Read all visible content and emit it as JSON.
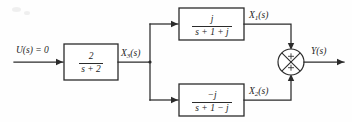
{
  "figure": {
    "type": "control-system-block-diagram",
    "background_color": "#fefefe",
    "line_color": "#2b2b2b",
    "width": 352,
    "height": 122
  },
  "signals": {
    "input": "U(s) = 0",
    "intermediate": "X",
    "intermediate_sub": "3",
    "intermediate_arg": "(s)",
    "upper_out": "X",
    "upper_out_sub": "1",
    "upper_out_arg": "(s)",
    "lower_out": "X",
    "lower_out_sub": "2",
    "lower_out_arg": "(s)",
    "output": "Y(s)"
  },
  "blocks": [
    {
      "id": "forward-block",
      "numerator": "2",
      "denominator": "s + 2",
      "transfer_function": "2/(s+2)"
    },
    {
      "id": "upper-branch-block",
      "numerator": "j",
      "denominator": "s + 1 + j",
      "transfer_function": "j/(s+1+j)"
    },
    {
      "id": "lower-branch-block",
      "numerator": "−j",
      "denominator": "s + 1 − j",
      "transfer_function": "-j/(s+1-j)"
    }
  ],
  "summing_junction": {
    "id": "summing-junction",
    "upper_sign": "+",
    "lower_sign": "+",
    "style": "circle-with-cross",
    "output_relation": "Y(s) = X1(s) + X2(s)"
  }
}
